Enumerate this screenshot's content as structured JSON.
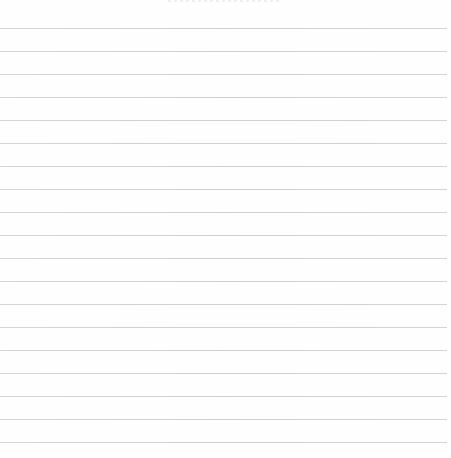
{
  "page": {
    "type": "ruled-notebook-page",
    "background_color": "#fefefe",
    "line_color": "#d0d0d0",
    "line_count": 19,
    "first_line_y": 28,
    "line_spacing": 23,
    "line_width": 447
  }
}
